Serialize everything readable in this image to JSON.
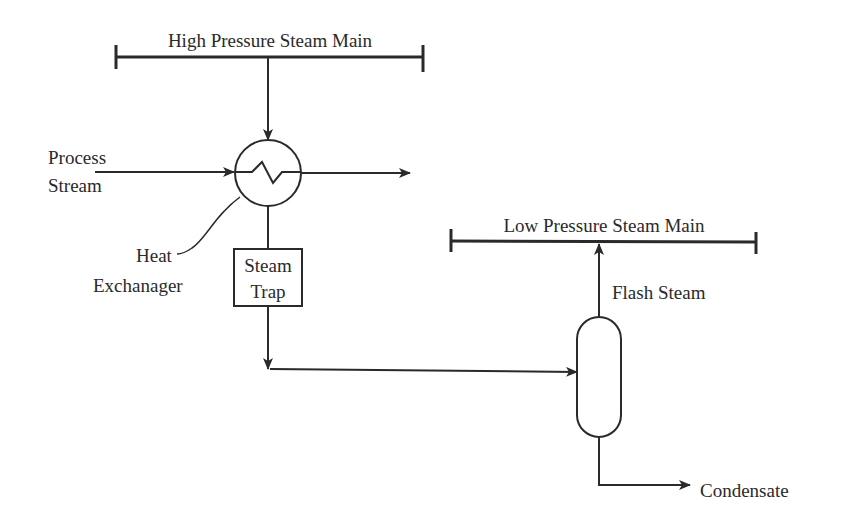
{
  "diagram": {
    "type": "process-flow",
    "labels": {
      "hp_main": "High Pressure Steam Main",
      "lp_main": "Low Pressure Steam Main",
      "process_stream_1": "Process",
      "process_stream_2": "Stream",
      "heat_exchanger_1": "Heat",
      "heat_exchanger_2": "Exchanager",
      "steam_trap_1": "Steam",
      "steam_trap_2": "Trap",
      "flash_steam": "Flash Steam",
      "condensate": "Condensate"
    },
    "nodes": [
      {
        "id": "hp_main",
        "label": "High Pressure Steam Main"
      },
      {
        "id": "heat_exchanger",
        "label": "Heat Exchanager"
      },
      {
        "id": "steam_trap",
        "label": "Steam Trap"
      },
      {
        "id": "flash_drum",
        "label": ""
      },
      {
        "id": "lp_main",
        "label": "Low Pressure Steam Main"
      }
    ],
    "edges": [
      {
        "from": "hp_main",
        "to": "heat_exchanger"
      },
      {
        "from": "process_stream_in",
        "to": "heat_exchanger",
        "label": "Process Stream"
      },
      {
        "from": "heat_exchanger",
        "to": "process_stream_out"
      },
      {
        "from": "heat_exchanger",
        "to": "steam_trap"
      },
      {
        "from": "steam_trap",
        "to": "flash_drum"
      },
      {
        "from": "flash_drum",
        "to": "lp_main",
        "label": "Flash Steam"
      },
      {
        "from": "flash_drum",
        "to": "condensate_out",
        "label": "Condensate"
      }
    ]
  }
}
